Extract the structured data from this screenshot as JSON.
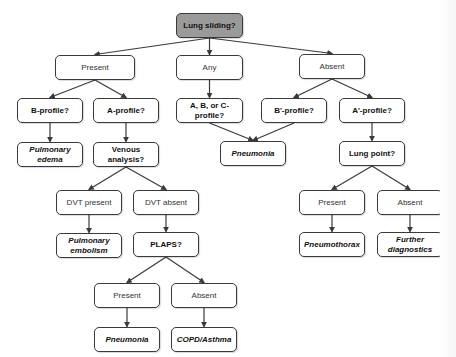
{
  "diagram": {
    "type": "flowchart",
    "colors": {
      "root_fill": "#9a9a9a",
      "node_fill": "#ffffff",
      "border": "#3a3a3a"
    },
    "nodes": [
      {
        "id": "lung_sliding",
        "label": "Lung sliding?",
        "kind": "root"
      },
      {
        "id": "present_1",
        "label": "Present",
        "kind": "answer"
      },
      {
        "id": "any",
        "label": "Any",
        "kind": "answer"
      },
      {
        "id": "absent_1",
        "label": "Absent",
        "kind": "answer"
      },
      {
        "id": "b_profile",
        "label": "B-profile?",
        "kind": "question"
      },
      {
        "id": "a_profile",
        "label": "A-profile?",
        "kind": "question"
      },
      {
        "id": "abc_profile",
        "label": "A, B, or C-profile?",
        "kind": "question"
      },
      {
        "id": "bprime_profile",
        "label": "B'-profile?",
        "kind": "question"
      },
      {
        "id": "aprime_profile",
        "label": "A'-profile?",
        "kind": "question"
      },
      {
        "id": "pulmonary_edema",
        "label": "Pulmonary edema",
        "kind": "diagnosis"
      },
      {
        "id": "venous_analysis",
        "label": "Venous analysis?",
        "kind": "question"
      },
      {
        "id": "pneumonia_1",
        "label": "Pneumonia",
        "kind": "diagnosis"
      },
      {
        "id": "lung_point",
        "label": "Lung point?",
        "kind": "question"
      },
      {
        "id": "dvt_present",
        "label": "DVT present",
        "kind": "answer"
      },
      {
        "id": "dvt_absent",
        "label": "DVT absent",
        "kind": "answer"
      },
      {
        "id": "present_lp",
        "label": "Present",
        "kind": "answer"
      },
      {
        "id": "absent_lp",
        "label": "Absent",
        "kind": "answer"
      },
      {
        "id": "pulmonary_embolism",
        "label": "Pulmonary embolism",
        "kind": "diagnosis"
      },
      {
        "id": "plaps",
        "label": "PLAPS?",
        "kind": "question"
      },
      {
        "id": "pneumothorax",
        "label": "Pneumothorax",
        "kind": "diagnosis"
      },
      {
        "id": "further_diagnostics",
        "label": "Further diagnostics",
        "kind": "diagnosis"
      },
      {
        "id": "present_plaps",
        "label": "Present",
        "kind": "answer"
      },
      {
        "id": "absent_plaps",
        "label": "Absent",
        "kind": "answer"
      },
      {
        "id": "pneumonia_2",
        "label": "Pneumonia",
        "kind": "diagnosis"
      },
      {
        "id": "copd_asthma",
        "label": "COPD/Asthma",
        "kind": "diagnosis"
      }
    ],
    "edges": [
      [
        "lung_sliding",
        "present_1"
      ],
      [
        "lung_sliding",
        "any"
      ],
      [
        "lung_sliding",
        "absent_1"
      ],
      [
        "present_1",
        "b_profile"
      ],
      [
        "present_1",
        "a_profile"
      ],
      [
        "any",
        "abc_profile"
      ],
      [
        "absent_1",
        "bprime_profile"
      ],
      [
        "absent_1",
        "aprime_profile"
      ],
      [
        "b_profile",
        "pulmonary_edema"
      ],
      [
        "a_profile",
        "venous_analysis"
      ],
      [
        "abc_profile",
        "pneumonia_1"
      ],
      [
        "bprime_profile",
        "pneumonia_1"
      ],
      [
        "aprime_profile",
        "lung_point"
      ],
      [
        "venous_analysis",
        "dvt_present"
      ],
      [
        "venous_analysis",
        "dvt_absent"
      ],
      [
        "lung_point",
        "present_lp"
      ],
      [
        "lung_point",
        "absent_lp"
      ],
      [
        "dvt_present",
        "pulmonary_embolism"
      ],
      [
        "dvt_absent",
        "plaps"
      ],
      [
        "present_lp",
        "pneumothorax"
      ],
      [
        "absent_lp",
        "further_diagnostics"
      ],
      [
        "plaps",
        "present_plaps"
      ],
      [
        "plaps",
        "absent_plaps"
      ],
      [
        "present_plaps",
        "pneumonia_2"
      ],
      [
        "absent_plaps",
        "copd_asthma"
      ]
    ]
  }
}
